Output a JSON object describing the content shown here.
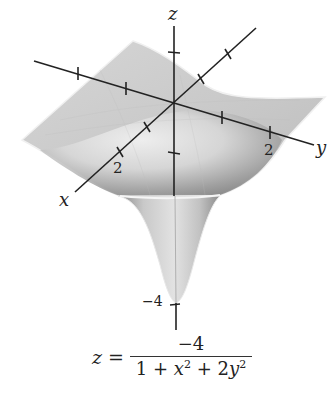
{
  "figure": {
    "type": "3d-surface-plot",
    "axes": {
      "x": {
        "label": "x",
        "tick_label": "2"
      },
      "y": {
        "label": "y",
        "tick_label": "2"
      },
      "z": {
        "label": "z",
        "tick_label": "−4"
      }
    },
    "colors": {
      "surface_light": "#e4e4e4",
      "surface_mid": "#c8c8c8",
      "surface_dark": "#8e8e8e",
      "axis": "#222222",
      "edge": "#f4f4f4"
    }
  },
  "formula": {
    "lhs": "z",
    "equals": "=",
    "numerator": "−4",
    "denominator": {
      "one": "1",
      "plus1": "+",
      "x": "x",
      "x_exp": "2",
      "plus2": "+",
      "coef": "2",
      "y": "y",
      "y_exp": "2"
    }
  }
}
